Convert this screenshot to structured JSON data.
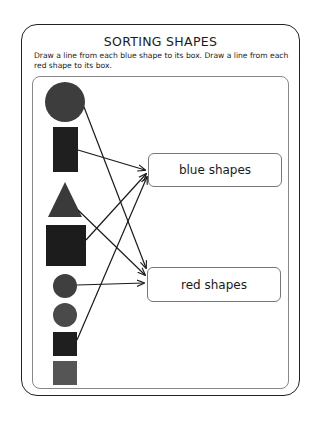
{
  "worksheet": {
    "title": "SORTING SHAPES",
    "instructions": "Draw a line from each blue shape to its box.  Draw a line from each red shape to its box.",
    "targets": {
      "blue": {
        "label": "blue shapes"
      },
      "red": {
        "label": "red shapes"
      }
    },
    "shapes": [
      {
        "type": "circle",
        "size": "large",
        "shade": "#3d3d3d",
        "connected_to": "red"
      },
      {
        "type": "rectangle",
        "size": "tall",
        "shade": "#1f1f1f",
        "connected_to": "blue"
      },
      {
        "type": "triangle",
        "size": "medium",
        "shade": "#3a3a3a",
        "connected_to": "red"
      },
      {
        "type": "square",
        "size": "large",
        "shade": "#1c1c1c",
        "connected_to": "blue"
      },
      {
        "type": "circle",
        "size": "small",
        "shade": "#3f3f3f",
        "connected_to": "red"
      },
      {
        "type": "circle",
        "size": "small",
        "shade": "#4a4a4a",
        "connected_to": null
      },
      {
        "type": "square",
        "size": "small",
        "shade": "#1f1f1f",
        "connected_to": "blue"
      },
      {
        "type": "square",
        "size": "small",
        "shade": "#555555",
        "connected_to": null
      }
    ]
  }
}
